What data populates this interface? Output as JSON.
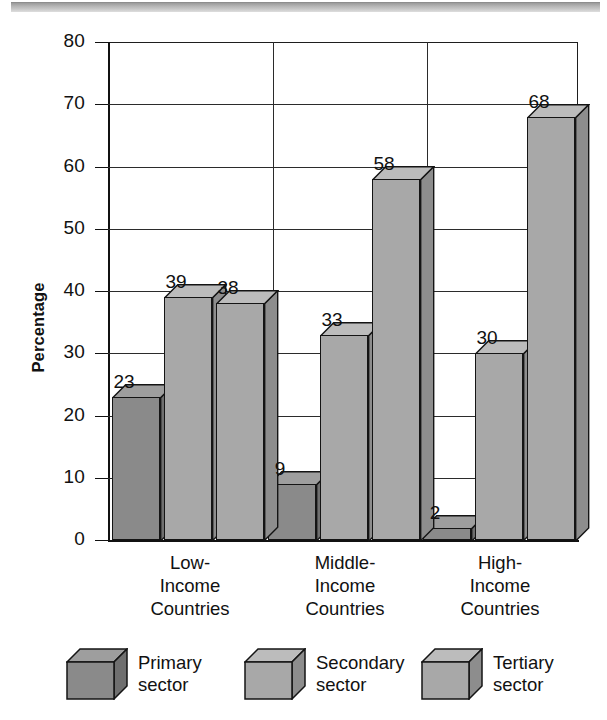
{
  "chart_data": {
    "type": "bar",
    "title": "",
    "xlabel": "",
    "ylabel": "Percentage",
    "ylim": [
      0,
      80
    ],
    "yticks": [
      0,
      10,
      20,
      30,
      40,
      50,
      60,
      70,
      80
    ],
    "grid": true,
    "legend_position": "bottom",
    "categories": [
      "Low-\nIncome\nCountries",
      "Middle-\nIncome\nCountries",
      "High-\nIncome\nCountries"
    ],
    "series": [
      {
        "name": "Primary sector",
        "values": [
          23,
          9,
          2
        ],
        "color": "#8a8a8a"
      },
      {
        "name": "Secondary sector",
        "values": [
          39,
          33,
          30
        ],
        "color": "#a8a8a8"
      },
      {
        "name": "Tertiary sector",
        "values": [
          38,
          58,
          68
        ],
        "color": "#a8a8a8"
      }
    ]
  },
  "axis": {
    "ylabel": "Percentage",
    "tick_labels": [
      "80",
      "70",
      "60",
      "50",
      "40",
      "30",
      "20",
      "10",
      "0"
    ]
  },
  "categories": [
    {
      "line1": "Low-",
      "line2": "Income",
      "line3": "Countries"
    },
    {
      "line1": "Middle-",
      "line2": "Income",
      "line3": "Countries"
    },
    {
      "line1": "High-",
      "line2": "Income",
      "line3": "Countries"
    }
  ],
  "bars": [
    {
      "value_label": "23",
      "group": "Low-Income Countries",
      "series": "Primary sector"
    },
    {
      "value_label": "39",
      "group": "Low-Income Countries",
      "series": "Secondary sector"
    },
    {
      "value_label": "38",
      "group": "Low-Income Countries",
      "series": "Tertiary sector"
    },
    {
      "value_label": "9",
      "group": "Middle-Income Countries",
      "series": "Primary sector"
    },
    {
      "value_label": "33",
      "group": "Middle-Income Countries",
      "series": "Secondary sector"
    },
    {
      "value_label": "58",
      "group": "Middle-Income Countries",
      "series": "Tertiary sector"
    },
    {
      "value_label": "2",
      "group": "High-Income Countries",
      "series": "Primary sector"
    },
    {
      "value_label": "30",
      "group": "High-Income Countries",
      "series": "Secondary sector"
    },
    {
      "value_label": "68",
      "group": "High-Income Countries",
      "series": "Tertiary sector"
    }
  ],
  "legend": [
    {
      "line1": "Primary",
      "line2": "sector",
      "swatch": "#8a8a8a"
    },
    {
      "line1": "Secondary",
      "line2": "sector",
      "swatch": "#a8a8a8"
    },
    {
      "line1": "Tertiary",
      "line2": "sector",
      "swatch": "#a8a8a8"
    }
  ],
  "colors": {
    "primary_face": "#8a8a8a",
    "primary_top": "#9e9e9e",
    "primary_side": "#6f6f6f",
    "other_face": "#a8a8a8",
    "other_top": "#bcbcbc",
    "other_side": "#8d8d8d",
    "axis": "#111111",
    "grid": "#2b2b2b",
    "header_bar": "#b4b4b4"
  }
}
